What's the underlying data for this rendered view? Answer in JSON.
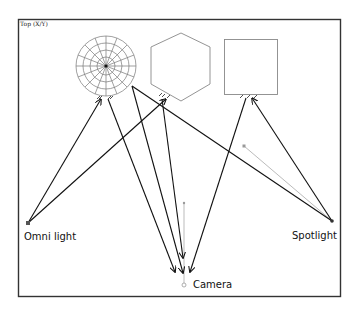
{
  "viewport": {
    "label": "Top (X/Y)"
  },
  "objects": {
    "sphere": {
      "name": "sphere"
    },
    "hexagon": {
      "name": "hexagon"
    },
    "box": {
      "name": "box"
    }
  },
  "lights": {
    "omni": {
      "label": "Omni light"
    },
    "spot": {
      "label": "Spotlight"
    }
  },
  "camera": {
    "label": "Camera"
  },
  "colors": {
    "frame": "#333333",
    "line": "#111111",
    "object": "#888888",
    "target": "#999999"
  }
}
